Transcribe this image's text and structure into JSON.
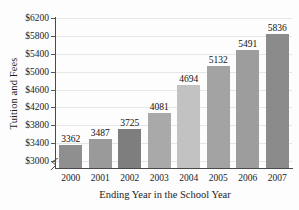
{
  "chart_data": {
    "type": "bar",
    "title": "",
    "xlabel": "Ending Year in the School Year",
    "ylabel": "Tuition and Fees",
    "categories": [
      "2000",
      "2001",
      "2002",
      "2003",
      "2004",
      "2005",
      "2006",
      "2007"
    ],
    "values": [
      3362,
      3487,
      3725,
      4081,
      4694,
      5132,
      5491,
      5836
    ],
    "value_labels": [
      "3362",
      "3487",
      "3725",
      "4081",
      "4694",
      "5132",
      "5491",
      "5836"
    ],
    "bar_colors": [
      "#8f8f8f",
      "#9a9a9a",
      "#7e7e7e",
      "#a9a9a9",
      "#c2c2c2",
      "#a3a3a3",
      "#9d9d9d",
      "#8b8b8b"
    ],
    "ylim": [
      3000,
      6200
    ],
    "ytick_values": [
      3000,
      3400,
      3800,
      4200,
      4600,
      5000,
      5400,
      5800,
      6200
    ],
    "ytick_labels": [
      "$3000",
      "$3400",
      "$3800",
      "$4200",
      "$4600",
      "$5000",
      "$5400",
      "$5800",
      "$6200"
    ],
    "grid": true,
    "grid_axis": "y",
    "legend": "none",
    "axis_break": true,
    "axis_break_position": "below $3000 on y-axis"
  }
}
